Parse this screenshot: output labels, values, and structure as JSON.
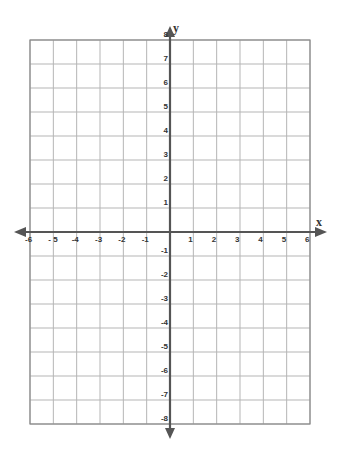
{
  "chart_data": {
    "type": "scatter",
    "title": "",
    "xlabel": "x",
    "ylabel": "y",
    "xlim": [
      -6,
      6
    ],
    "ylim": [
      -8,
      8
    ],
    "grid": true,
    "x_ticks": [
      -6,
      -5,
      -4,
      -3,
      -2,
      -1,
      1,
      2,
      3,
      4,
      5,
      6
    ],
    "x_tick_labels": [
      "-6",
      "- 5",
      "-4",
      "-3",
      "-2",
      "-1",
      "1",
      "2",
      "3",
      "4",
      "5",
      "6"
    ],
    "y_ticks": [
      8,
      7,
      6,
      5,
      4,
      3,
      2,
      1,
      -1,
      -2,
      -3,
      -4,
      -5,
      -6,
      -7,
      -8
    ],
    "y_tick_labels": [
      "8",
      "7",
      "6",
      "5",
      "4",
      "3",
      "2",
      "1",
      "-1",
      "-2",
      "-3",
      "-4",
      "-5",
      "-6",
      "-7",
      "-8"
    ],
    "series": [],
    "legend": null
  },
  "colors": {
    "grid": "#b5b5b5",
    "border": "#8a8a8a",
    "axis": "#555555",
    "text": "#333333"
  },
  "layout": {
    "grid_left": 30,
    "grid_right": 310,
    "grid_top": 40,
    "grid_bottom": 424,
    "origin_x": 170,
    "origin_y": 232
  }
}
